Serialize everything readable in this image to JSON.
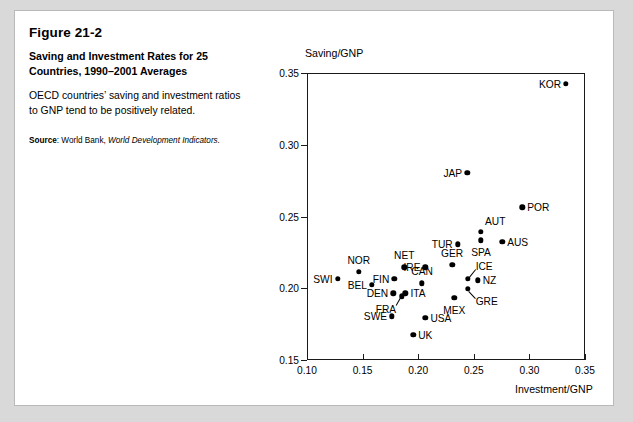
{
  "figure": {
    "number": "Figure 21-2",
    "title": "Saving and Investment Rates for 25 Countries, 1990–2001 Averages",
    "description": "OECD countries’ saving and investment ratios to GNP tend to be positively related.",
    "source_lead": "Source",
    "source_sep": ": World Bank, ",
    "source_italic": "World Development Indicators."
  },
  "chart_data": {
    "type": "scatter",
    "title": "Saving and Investment Rates for 25 Countries, 1990–2001 Averages",
    "xlabel": "Investment/GNP",
    "ylabel": "Saving/GNP",
    "xlim": [
      0.1,
      0.35
    ],
    "ylim": [
      0.15,
      0.35
    ],
    "xticks": [
      "0.10",
      "0.15",
      "0.20",
      "0.25",
      "0.30",
      "0.35"
    ],
    "yticks": [
      "0.35",
      "0.30",
      "0.25",
      "0.20",
      "0.15"
    ],
    "xtick_values": [
      0.1,
      0.15,
      0.2,
      0.25,
      0.3,
      0.35
    ],
    "ytick_values": [
      0.35,
      0.3,
      0.25,
      0.2,
      0.15
    ],
    "grid": false,
    "legend": false,
    "marker": "filled-circle",
    "marker_color": "#000000",
    "points": [
      {
        "label": "KOR",
        "x": 0.333,
        "y": 0.3425,
        "label_pos": "left"
      },
      {
        "label": "JAP",
        "x": 0.244,
        "y": 0.2805,
        "label_pos": "left"
      },
      {
        "label": "POR",
        "x": 0.2935,
        "y": 0.2565,
        "label_pos": "right"
      },
      {
        "label": "AUT",
        "x": 0.2565,
        "y": 0.2395,
        "label_pos": "above-right"
      },
      {
        "label": "SPA",
        "x": 0.2565,
        "y": 0.2335,
        "label_pos": "below"
      },
      {
        "label": "AUS",
        "x": 0.2755,
        "y": 0.2325,
        "label_pos": "right"
      },
      {
        "label": "TUR",
        "x": 0.2355,
        "y": 0.2305,
        "label_pos": "left"
      },
      {
        "label": "GER",
        "x": 0.2305,
        "y": 0.2165,
        "label_pos": "above"
      },
      {
        "label": "NET",
        "x": 0.1875,
        "y": 0.2145,
        "label_pos": "above"
      },
      {
        "label": "IRE",
        "x": 0.2065,
        "y": 0.2145,
        "label_pos": "left"
      },
      {
        "label": "ICE",
        "x": 0.2445,
        "y": 0.2065,
        "label_pos": "above-right-leader"
      },
      {
        "label": "NOR",
        "x": 0.1465,
        "y": 0.2115,
        "label_pos": "above"
      },
      {
        "label": "FIN",
        "x": 0.1785,
        "y": 0.2065,
        "label_pos": "left"
      },
      {
        "label": "CAN",
        "x": 0.2035,
        "y": 0.2035,
        "label_pos": "above"
      },
      {
        "label": "SWI",
        "x": 0.1275,
        "y": 0.2065,
        "label_pos": "left"
      },
      {
        "label": "NZ",
        "x": 0.2535,
        "y": 0.2055,
        "label_pos": "right"
      },
      {
        "label": "BEL",
        "x": 0.1585,
        "y": 0.2025,
        "label_pos": "left"
      },
      {
        "label": "GRE",
        "x": 0.2445,
        "y": 0.1995,
        "label_pos": "below-right-leader"
      },
      {
        "label": "ITA",
        "x": 0.1885,
        "y": 0.1965,
        "label_pos": "right"
      },
      {
        "label": "DEN",
        "x": 0.1775,
        "y": 0.1965,
        "label_pos": "left"
      },
      {
        "label": "MEX",
        "x": 0.2325,
        "y": 0.1935,
        "label_pos": "below"
      },
      {
        "label": "FRA",
        "x": 0.1855,
        "y": 0.1945,
        "label_pos": "below-left-leader"
      },
      {
        "label": "SWE",
        "x": 0.1765,
        "y": 0.1805,
        "label_pos": "left"
      },
      {
        "label": "USA",
        "x": 0.2065,
        "y": 0.1795,
        "label_pos": "right"
      },
      {
        "label": "UK",
        "x": 0.1955,
        "y": 0.1675,
        "label_pos": "right"
      }
    ]
  }
}
